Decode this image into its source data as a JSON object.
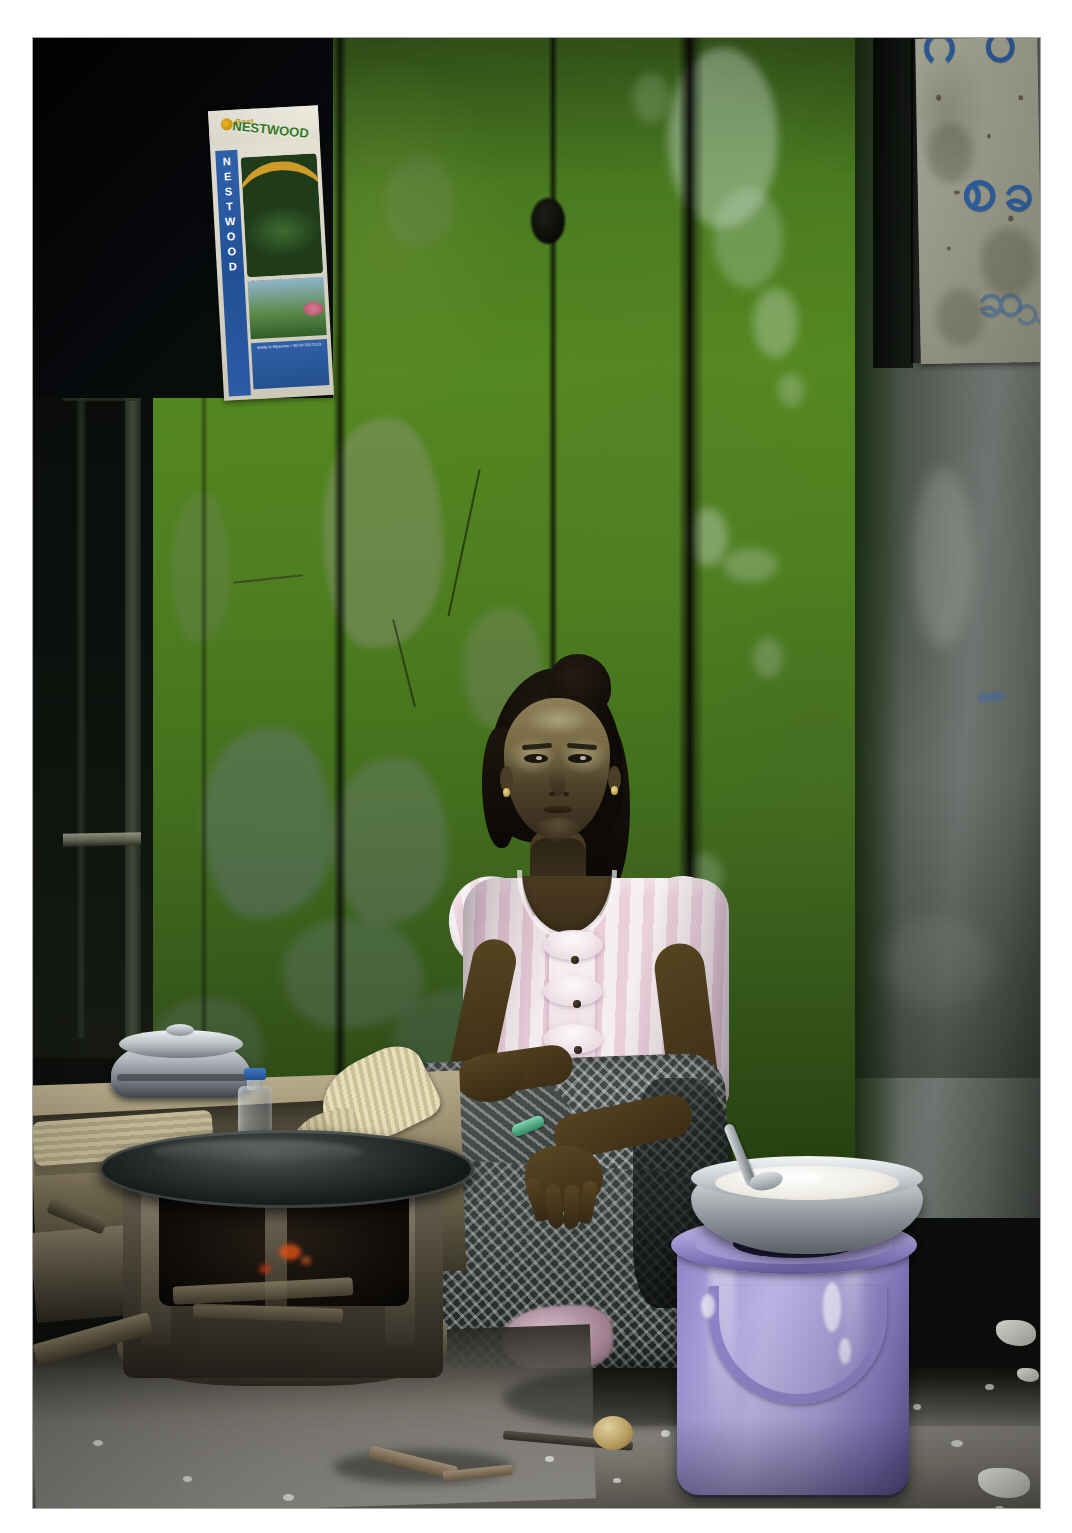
{
  "scene": {
    "title": "Street vendor seated against a weathered green door",
    "location_hint": "Myanmar street kitchen",
    "alt_text": "A woman with thanaka paste on her cheeks sits on the ground against a peeling green painted wooden door, beside a clay charcoal stove with a dark griddle and a lavender plastic bucket topped by an aluminium bowl of white batter."
  },
  "border": {
    "mat_color": "#ffffff",
    "photo_left": 33,
    "photo_top": 38,
    "photo_width": 1007,
    "photo_height": 1470
  },
  "palette": {
    "wall_green": "#4d7d1e",
    "wall_green_dark": "#24400f",
    "concrete_grey": "#6e746f",
    "bucket_lavender": "#a79cd8",
    "bucket_lavender_dark": "#645a99",
    "blouse_pink": "#e9cbd8",
    "blouse_white": "#f6eef1",
    "longyi_dark": "#2b3130",
    "ground_grey": "#8a8780",
    "ember_orange": "#e15014",
    "poster_blue": "#2f62ad",
    "poster_green": "#2f7a22",
    "poster_gold": "#e0a42a",
    "script_blue": "#2f63a8",
    "skin": "#4a3b22",
    "thanaka": "#cec696"
  },
  "poster_nestwood": {
    "name": "nestwood-poster",
    "brand_mark": "Best",
    "arch_text": "NESTWOOD",
    "vertical_letters": [
      "N",
      "E",
      "S",
      "T",
      "W",
      "O",
      "O",
      "D"
    ],
    "caption_top": "Quality plywood and timber products",
    "caption_bottom": "Made in Myanmar  •  Tel 09 555 0123",
    "tilt_degrees": -3.2
  },
  "paper_top_right": {
    "name": "burmese-script-paper",
    "material": "weathered paper notice",
    "script_glyphs": [
      "ဂ",
      "ပ",
      "စ",
      "ခ",
      "ဆ",
      "သ",
      "ဒ"
    ],
    "ink_color": "#2f63a8"
  },
  "wall": {
    "name": "green-painted-door",
    "finish": "peeling oil paint over wood planks",
    "plank_seam_count": 4,
    "pillar_name": "concrete-pillar",
    "pillar_finish": "mossy weathered concrete",
    "window_name": "dark-window-recess"
  },
  "woman": {
    "name": "seated-woman",
    "face_makeup": "thanaka",
    "hair": "dark hair tied back",
    "blouse": "pink and white striped puff-sleeve blouse",
    "blouse_buttons": 3,
    "skirt": "dark houndstooth-check longyi",
    "accessory": "green bangle on right wrist",
    "earrings": "small gold studs",
    "pose": "seated on ground, hands resting on knee, facing camera"
  },
  "objects": [
    {
      "name": "clay-charcoal-stove",
      "detail": "mud stove with glowing embers and firewood"
    },
    {
      "name": "griddle-pan",
      "detail": "large blackened flat iron griddle"
    },
    {
      "name": "aluminium-pot",
      "detail": "dented aluminium pot with lid"
    },
    {
      "name": "water-bottle",
      "detail": "clear plastic bottle with blue cap"
    },
    {
      "name": "woven-bamboo-fan",
      "detail": "pale woven bamboo fan / basket lid"
    },
    {
      "name": "lavender-bucket",
      "detail": "lilac plastic bucket with lid and handle"
    },
    {
      "name": "batter-bowl",
      "detail": "aluminium bowl full of white rice batter"
    },
    {
      "name": "metal-ladle",
      "detail": "steel ladle resting in the batter"
    },
    {
      "name": "wooden-stool",
      "detail": "low wooden stool at left edge"
    },
    {
      "name": "straw-mat",
      "detail": "pale straw mat on the ledge"
    }
  ],
  "ground": {
    "name": "gravel-ground",
    "detail": "grey gravel and dirt with white stones, twigs and scattered litter"
  }
}
